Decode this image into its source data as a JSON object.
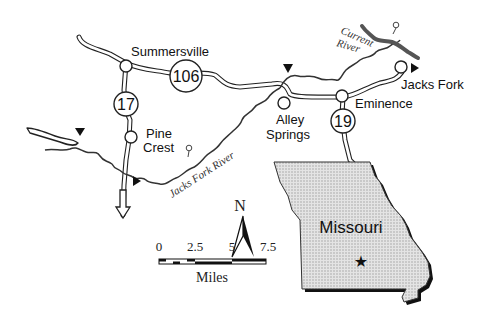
{
  "map": {
    "towns": [
      {
        "name": "Summersville"
      },
      {
        "name": "Pine",
        "name2": "Crest"
      },
      {
        "name": "Alley",
        "name2": "Springs"
      },
      {
        "name": "Eminence"
      },
      {
        "name": "Jacks Fork"
      }
    ],
    "highways": [
      {
        "number": "106"
      },
      {
        "number": "17"
      },
      {
        "number": "19"
      }
    ],
    "rivers": [
      {
        "name": "Jacks Fork River"
      },
      {
        "name": "Current",
        "name2": "River"
      }
    ],
    "inset": {
      "state": "Missouri",
      "marker": "star"
    },
    "north_arrow": {
      "label": "N"
    },
    "scale_bar": {
      "ticks": [
        "0",
        "2.5",
        "5",
        "7.5"
      ],
      "unit": "Miles"
    },
    "colors": {
      "ink": "#111111",
      "state_fill": "#d9d9d9",
      "background": "#ffffff"
    }
  }
}
